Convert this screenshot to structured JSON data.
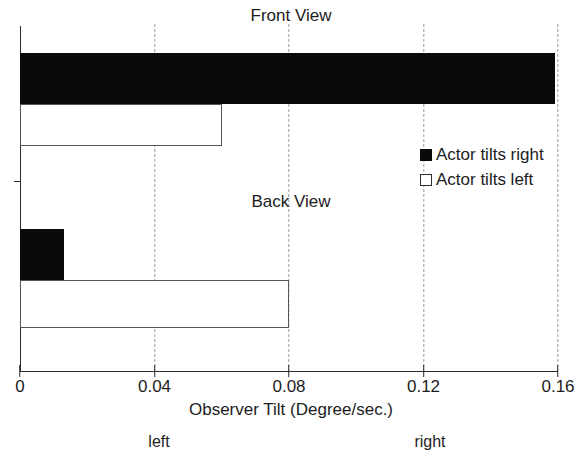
{
  "chart_data": {
    "type": "bar",
    "orientation": "horizontal",
    "title": "",
    "xlabel": "Observer Tilt (Degree/sec.)",
    "ylabel": "",
    "xlim": [
      0,
      0.16
    ],
    "xticks": [
      0,
      0.04,
      0.08,
      0.12,
      0.16
    ],
    "xticklabels": [
      "0",
      "0.04",
      "0.08",
      "0.12",
      "0.16"
    ],
    "grid": "vertical dashed at x ticks",
    "legend_position": "right-middle",
    "panels": [
      {
        "label": "Front View",
        "bars": [
          {
            "series": "Actor tilts right",
            "value": 0.159,
            "style": "filled"
          },
          {
            "series": "Actor tilts left",
            "value": 0.06,
            "style": "hollow"
          }
        ]
      },
      {
        "label": "Back View",
        "bars": [
          {
            "series": "Actor tilts right",
            "value": 0.013,
            "style": "filled"
          },
          {
            "series": "Actor tilts left",
            "value": 0.08,
            "style": "hollow"
          }
        ]
      }
    ],
    "series": [
      {
        "name": "Actor tilts right",
        "style": "filled",
        "values": [
          0.159,
          0.013
        ]
      },
      {
        "name": "Actor tilts left",
        "style": "hollow",
        "values": [
          0.06,
          0.08
        ]
      }
    ],
    "categories": [
      "Front View",
      "Back View"
    ],
    "annotations": [
      {
        "text": "left",
        "near_x": 0.04
      },
      {
        "text": "right",
        "near_x": 0.12
      }
    ],
    "colors": {
      "filled": "#0a0a0a",
      "hollow_fill": "#ffffff",
      "hollow_edge": "#555555",
      "axis": "#2b2b2b",
      "grid": "#9a9a9a"
    }
  },
  "panel_titles": {
    "front": "Front View",
    "back": "Back View"
  },
  "legend": {
    "items": [
      {
        "label": "Actor tilts right",
        "style": "filled"
      },
      {
        "label": "Actor tilts left",
        "style": "hollow"
      }
    ]
  },
  "axis": {
    "x_title": "Observer Tilt (Degree/sec.)",
    "ticks": [
      {
        "label": "0",
        "value": 0
      },
      {
        "label": "0.04",
        "value": 0.04
      },
      {
        "label": "0.08",
        "value": 0.08
      },
      {
        "label": "0.12",
        "value": 0.12
      },
      {
        "label": "0.16",
        "value": 0.16
      }
    ]
  },
  "direction_notes": {
    "left": "left",
    "right": "right"
  }
}
